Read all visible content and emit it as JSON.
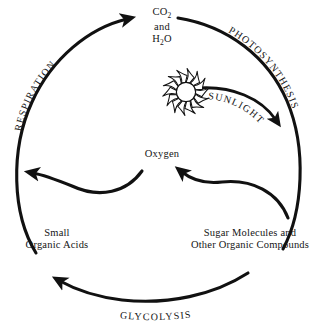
{
  "diagram": {
    "background_color": "#ffffff",
    "stroke_color": "#111111",
    "text_color": "#151515",
    "nodes": [
      {
        "id": "co2-water",
        "lines": [
          "CO",
          "and",
          "H",
          "O"
        ],
        "line1_main": "CO",
        "line1_sub": "2",
        "line2": "and",
        "line3_main": "H",
        "line3_sub": "2",
        "line3_tail": "O",
        "position": "top"
      },
      {
        "id": "oxygen",
        "label": "Oxygen",
        "position": "center"
      },
      {
        "id": "small-organic-acids",
        "line1": "Small",
        "line2": "Organic Acids",
        "position": "bottom-left"
      },
      {
        "id": "sugar-molecules",
        "line1": "Sugar Molecules and",
        "line2": "Other Organic Compounds",
        "position": "bottom-right"
      }
    ],
    "process_labels": [
      {
        "id": "respiration",
        "label": "RESPIRATION",
        "position": "upper-left-arc"
      },
      {
        "id": "photosynthesis",
        "label": "PHOTOSYNTHESIS",
        "position": "upper-right-arc"
      },
      {
        "id": "sunlight",
        "label": "SUNLIGHT",
        "position": "inner-right-arc"
      },
      {
        "id": "glycolysis",
        "label": "GLYCOLYSIS",
        "position": "bottom-arc"
      }
    ],
    "icons": [
      {
        "id": "sun",
        "name": "sun-icon",
        "rays": 14,
        "position": "upper-center-right"
      }
    ],
    "arrows": [
      {
        "id": "respiration-arrow",
        "from": "small-organic-acids",
        "to": "co2-water",
        "direction": "counter-clockwise-up-right"
      },
      {
        "id": "photosynthesis-arrow",
        "from": "co2-water",
        "to": "sugar-molecules",
        "direction": "clockwise-down-right"
      },
      {
        "id": "sunlight-arrow",
        "from": "sun",
        "to": "photosynthesis-arc",
        "direction": "down-right"
      },
      {
        "id": "oxygen-to-left-arrow",
        "from": "oxygen",
        "to": "respiration-arc",
        "direction": "left"
      },
      {
        "id": "sugar-to-oxygen-arrow",
        "from": "photosynthesis-arc",
        "to": "oxygen",
        "direction": "up-left"
      },
      {
        "id": "glycolysis-arrow",
        "from": "sugar-molecules",
        "to": "small-organic-acids",
        "direction": "left"
      }
    ]
  }
}
